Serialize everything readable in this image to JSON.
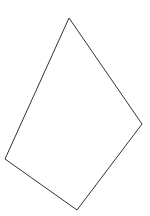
{
  "diagram": {
    "type": "quadrilateral",
    "stroke_color": "#333333",
    "fill_color": "none",
    "vertices": [
      {
        "x": 69,
        "y": 18
      },
      {
        "x": 142,
        "y": 124
      },
      {
        "x": 77,
        "y": 210
      },
      {
        "x": 5,
        "y": 159
      }
    ]
  }
}
